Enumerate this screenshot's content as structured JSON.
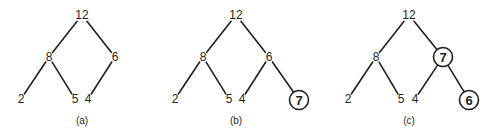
{
  "diagram": {
    "panels": [
      {
        "caption": "(a)",
        "nodes": [
          {
            "id": "n12",
            "label": "12",
            "x": 82,
            "y": 15,
            "highlight": false
          },
          {
            "id": "n8",
            "label": "8",
            "x": 49,
            "y": 57,
            "highlight": false
          },
          {
            "id": "n6",
            "label": "6",
            "x": 115,
            "y": 57,
            "highlight": false
          },
          {
            "id": "n2",
            "label": "2",
            "x": 21,
            "y": 99,
            "highlight": false
          },
          {
            "id": "n5",
            "label": "5",
            "x": 75,
            "y": 99,
            "highlight": false
          },
          {
            "id": "n4",
            "label": "4",
            "x": 88,
            "y": 99,
            "highlight": false
          }
        ],
        "edges": [
          [
            "n12",
            "n8"
          ],
          [
            "n12",
            "n6"
          ],
          [
            "n8",
            "n2"
          ],
          [
            "n8",
            "n5"
          ],
          [
            "n6",
            "n4"
          ]
        ],
        "caption_pos": {
          "x": 82,
          "y": 120
        }
      },
      {
        "caption": "(b)",
        "nodes": [
          {
            "id": "n12",
            "label": "12",
            "x": 236,
            "y": 15,
            "highlight": false
          },
          {
            "id": "n8",
            "label": "8",
            "x": 203,
            "y": 57,
            "highlight": false
          },
          {
            "id": "n6",
            "label": "6",
            "x": 269,
            "y": 57,
            "highlight": false
          },
          {
            "id": "n2",
            "label": "2",
            "x": 175,
            "y": 99,
            "highlight": false
          },
          {
            "id": "n5",
            "label": "5",
            "x": 229,
            "y": 99,
            "highlight": false
          },
          {
            "id": "n4",
            "label": "4",
            "x": 242,
            "y": 99,
            "highlight": false
          },
          {
            "id": "n7",
            "label": "7",
            "x": 299,
            "y": 100,
            "highlight": true
          }
        ],
        "edges": [
          [
            "n12",
            "n8"
          ],
          [
            "n12",
            "n6"
          ],
          [
            "n8",
            "n2"
          ],
          [
            "n8",
            "n5"
          ],
          [
            "n6",
            "n4"
          ],
          [
            "n6",
            "n7"
          ]
        ],
        "caption_pos": {
          "x": 236,
          "y": 120
        }
      },
      {
        "caption": "(c)",
        "nodes": [
          {
            "id": "n12",
            "label": "12",
            "x": 409,
            "y": 15,
            "highlight": false
          },
          {
            "id": "n8",
            "label": "8",
            "x": 376,
            "y": 57,
            "highlight": false
          },
          {
            "id": "n7",
            "label": "7",
            "x": 443,
            "y": 57,
            "highlight": true
          },
          {
            "id": "n2",
            "label": "2",
            "x": 348,
            "y": 99,
            "highlight": false
          },
          {
            "id": "n5",
            "label": "5",
            "x": 401,
            "y": 99,
            "highlight": false
          },
          {
            "id": "n4",
            "label": "4",
            "x": 415,
            "y": 99,
            "highlight": false
          },
          {
            "id": "n6",
            "label": "6",
            "x": 469,
            "y": 100,
            "highlight": true
          }
        ],
        "edges": [
          [
            "n12",
            "n8"
          ],
          [
            "n12",
            "n7"
          ],
          [
            "n8",
            "n2"
          ],
          [
            "n8",
            "n5"
          ],
          [
            "n7",
            "n4"
          ],
          [
            "n7",
            "n6"
          ]
        ],
        "caption_pos": {
          "x": 409,
          "y": 120
        }
      }
    ],
    "colors": {
      "ink": "#231f20",
      "background": "#ffffff"
    }
  }
}
